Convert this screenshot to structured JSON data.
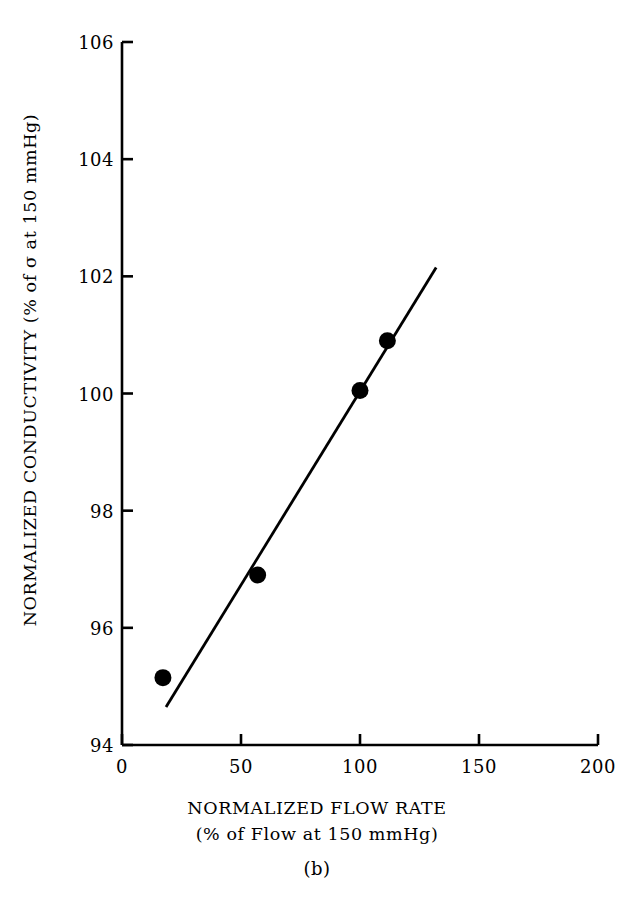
{
  "figure": {
    "panel_caption": "(b)"
  },
  "chart_data": {
    "type": "scatter",
    "title": "",
    "xlabel": "NORMALIZED FLOW RATE",
    "xlabel_line2": "(% of Flow at 150 mmHg)",
    "ylabel": "NORMALIZED CONDUCTIVITY (% of σ at 150 mmHg)",
    "xlim": [
      0,
      200
    ],
    "ylim": [
      94,
      106
    ],
    "xticks": [
      0,
      50,
      100,
      150,
      200
    ],
    "yticks": [
      94,
      96,
      98,
      100,
      102,
      104,
      106
    ],
    "xticklabels": [
      "0",
      "50",
      "100",
      "150",
      "200"
    ],
    "yticklabels": [
      "94",
      "96",
      "98",
      "100",
      "102",
      "104",
      "106"
    ],
    "grid": false,
    "legend": false,
    "marker": "filled-circle",
    "marker_color": "#000000",
    "line_color": "#000000",
    "points": [
      {
        "x": 17.2,
        "y": 95.15
      },
      {
        "x": 57.0,
        "y": 96.9
      },
      {
        "x": 100.0,
        "y": 100.05
      },
      {
        "x": 111.5,
        "y": 100.9
      }
    ],
    "fit_line": {
      "x_start": 18.5,
      "y_start": 94.65,
      "x_end": 132.0,
      "y_end": 102.15
    }
  }
}
